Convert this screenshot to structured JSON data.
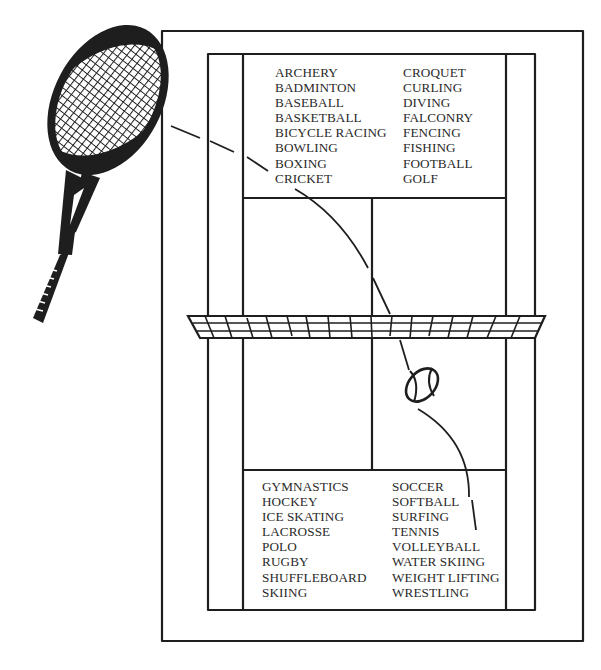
{
  "top_list": {
    "left": [
      "ARCHERY",
      "BADMINTON",
      "BASEBALL",
      "BASKETBALL",
      "BICYCLE RACING",
      "BOWLING",
      "BOXING",
      "CRICKET"
    ],
    "right": [
      "CROQUET",
      "CURLING",
      "DIVING",
      "FALCONRY",
      "FENCING",
      "FISHING",
      "FOOTBALL",
      "GOLF"
    ]
  },
  "bottom_list": {
    "left": [
      "GYMNASTICS",
      "HOCKEY",
      "ICE SKATING",
      "LACROSSE",
      "POLO",
      "RUGBY",
      "SHUFFLEBOARD",
      "SKIING"
    ],
    "right": [
      "SOCCER",
      "SOFTBALL",
      "SURFING",
      "TENNIS",
      "VOLLEYBALL",
      "WATER SKIING",
      "WEIGHT LIFTING",
      "WRESTLING"
    ]
  },
  "colors": {
    "ink": "#1e1e1e",
    "background": "#ffffff"
  }
}
